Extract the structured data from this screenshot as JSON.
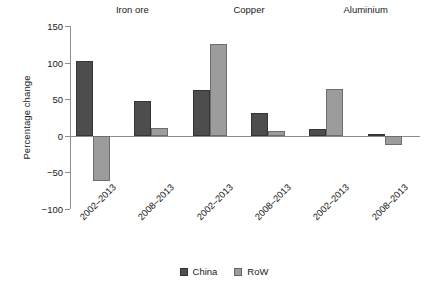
{
  "chart_data": {
    "type": "bar",
    "title": "",
    "subtitle": "",
    "xlabel": "",
    "ylabel": "Percentage change",
    "ylim": [
      -100,
      150
    ],
    "yticks": [
      150,
      100,
      50,
      0,
      -50,
      -100
    ],
    "ytick_labels": [
      "150",
      "100",
      "50",
      "0",
      "−50",
      "−100"
    ],
    "grid": false,
    "legend_position": "bottom-center",
    "group_labels": [
      "Iron ore",
      "Copper",
      "Aluminium"
    ],
    "categories": [
      "2002–2013",
      "2008–2013",
      "2002–2013",
      "2008–2013",
      "2002–2013",
      "2008–2013"
    ],
    "series": [
      {
        "name": "China",
        "color": "#4d4d4d",
        "values": [
          102,
          47,
          62,
          31,
          9,
          3
        ]
      },
      {
        "name": "RoW",
        "color": "#9c9c9c",
        "values": [
          -62,
          11,
          125,
          7,
          64,
          -13
        ]
      }
    ],
    "groups": [
      {
        "label": "Iron ore",
        "periods": [
          {
            "label": "2002–2013",
            "China": 102,
            "RoW": -62
          },
          {
            "label": "2008–2013",
            "China": 47,
            "RoW": 11
          }
        ]
      },
      {
        "label": "Copper",
        "periods": [
          {
            "label": "2002–2013",
            "China": 62,
            "RoW": 125
          },
          {
            "label": "2008–2013",
            "China": 31,
            "RoW": 7
          }
        ]
      },
      {
        "label": "Aluminium",
        "periods": [
          {
            "label": "2002–2013",
            "China": 9,
            "RoW": 64
          },
          {
            "label": "2008–2013",
            "China": 3,
            "RoW": -13
          }
        ]
      }
    ],
    "legend": [
      {
        "label": "China",
        "color": "#4d4d4d"
      },
      {
        "label": "RoW",
        "color": "#9c9c9c"
      }
    ]
  }
}
